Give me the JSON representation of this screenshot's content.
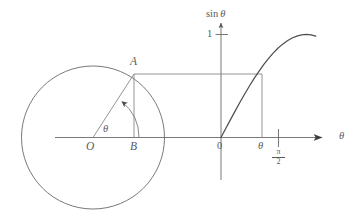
{
  "figure": {
    "stroke_color": "#59595b",
    "background_color": "#ffffff"
  },
  "labels": {
    "point_a": "A",
    "point_b": "B",
    "origin_o": "O",
    "angle_theta_circle": "θ",
    "y_axis_title_fn": "sin",
    "y_axis_title_arg": "θ",
    "y_tick_one": "1",
    "x_origin_zero": "0",
    "x_theta": "θ",
    "x_axis_title": "θ",
    "pi_over_two_numerator": "π",
    "pi_over_two_denominator": "2"
  },
  "chart_data": {
    "type": "line",
    "title": "",
    "xlabel": "θ",
    "ylabel": "sin θ",
    "xlim": [
      0,
      1.7453
    ],
    "ylim": [
      0,
      1.12
    ],
    "grid": false,
    "legend": null,
    "x_tick_labels": [
      "0",
      "θ",
      "π/2"
    ],
    "x_tick_values": [
      0,
      0.84,
      1.5708
    ],
    "y_tick_labels": [
      "1"
    ],
    "y_tick_values": [
      1
    ],
    "series": [
      {
        "name": "sin θ",
        "x": [
          0.0,
          0.0873,
          0.1745,
          0.2618,
          0.3491,
          0.4363,
          0.5236,
          0.6109,
          0.6981,
          0.7854,
          0.8727,
          0.9599,
          1.0472,
          1.1345,
          1.2217,
          1.309,
          1.3963,
          1.4835,
          1.5708,
          1.6581,
          1.7453
        ],
        "y": [
          0.0,
          0.0872,
          0.1736,
          0.2588,
          0.342,
          0.4226,
          0.5,
          0.5736,
          0.6428,
          0.7071,
          0.766,
          0.8192,
          0.866,
          0.9063,
          0.9397,
          0.9659,
          0.9848,
          0.9962,
          1.0,
          0.9962,
          0.9848
        ]
      }
    ],
    "annotations": [
      {
        "name": "horizontal-correspondence-line",
        "text": "",
        "from": "A on circle",
        "to": "point on sine curve at theta",
        "y_value": 0.745
      },
      {
        "name": "vertical-drop-line",
        "text": "",
        "x_value": 0.84,
        "y_from": 0.745,
        "y_to": 0.0
      }
    ],
    "circle": {
      "center_label": "O",
      "radius_endpoint_label": "A",
      "foot_of_perpendicular_label": "B",
      "angle_label": "θ",
      "angle_degrees": 48
    }
  }
}
